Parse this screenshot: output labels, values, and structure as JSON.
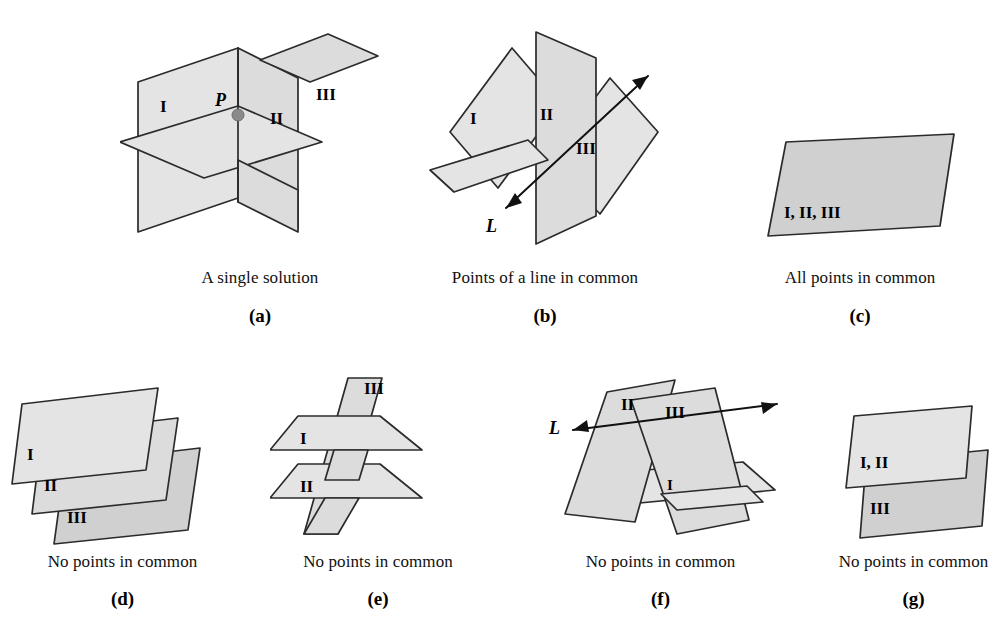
{
  "figure": {
    "colors": {
      "plane_fill_light": "#e4e4e4",
      "plane_fill_mid": "#dcdcdc",
      "plane_fill_dark": "#d0d0d0",
      "plane_stroke": "#2b2b2b",
      "line_stroke": "#111111",
      "point_marker": "#8a8a8a",
      "background": "#ffffff",
      "text": "#000000"
    }
  },
  "panels": [
    {
      "id": "a",
      "letter": "(a)",
      "caption": "A single solution",
      "plane_labels": [
        "I",
        "II",
        "III"
      ],
      "point_label": "P",
      "description": "Three planes meeting at a single point P"
    },
    {
      "id": "b",
      "letter": "(b)",
      "caption": "Points of a line in common",
      "plane_labels": [
        "I",
        "II",
        "III"
      ],
      "line_label": "L",
      "description": "Three planes sharing a common line L"
    },
    {
      "id": "c",
      "letter": "(c)",
      "caption": "All points in common",
      "plane_labels": [
        "I, II, III"
      ],
      "description": "Three coincident planes"
    },
    {
      "id": "d",
      "letter": "(d)",
      "caption": "No points in common",
      "plane_labels": [
        "I",
        "II",
        "III"
      ],
      "description": "Three distinct parallel planes"
    },
    {
      "id": "e",
      "letter": "(e)",
      "caption": "No points in common",
      "plane_labels": [
        "I",
        "II",
        "III"
      ],
      "description": "Two parallel planes cut by a third plane"
    },
    {
      "id": "f",
      "letter": "(f)",
      "caption": "No points in common",
      "plane_labels": [
        "I",
        "II",
        "III"
      ],
      "line_label": "L",
      "description": "Two planes meeting in line L with a third plane crossing both"
    },
    {
      "id": "g",
      "letter": "(g)",
      "caption": "No points in common",
      "plane_labels": [
        "I, II",
        "III"
      ],
      "description": "Two coincident planes parallel to a third plane"
    }
  ]
}
